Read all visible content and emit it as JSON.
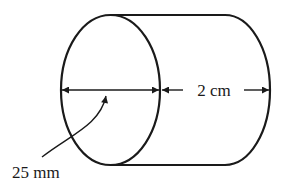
{
  "figure": {
    "type": "cylinder-dimension-diagram",
    "stroke_color": "#1a1a1a",
    "background": "#ffffff"
  },
  "labels": {
    "length": "2 cm",
    "diameter": "25 mm"
  },
  "dimensions": [
    {
      "name": "diameter",
      "value": "25 mm",
      "orientation": "horizontal",
      "across": "front circular face"
    },
    {
      "name": "length",
      "value": "2 cm",
      "orientation": "horizontal",
      "across": "cylinder body"
    }
  ]
}
